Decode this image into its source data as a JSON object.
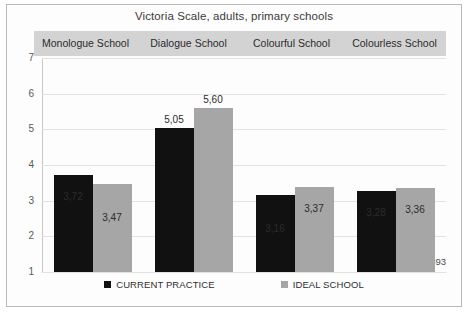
{
  "chart_data": {
    "type": "bar",
    "title": "Victoria Scale, adults, primary schools",
    "xlabel": "",
    "ylabel": "",
    "ylim": [
      1,
      7
    ],
    "yticks": [
      "7",
      "6",
      "5",
      "4",
      "3",
      "2",
      "1"
    ],
    "grid": true,
    "legend_position": "bottom",
    "categories": [
      "Monologue School",
      "Dialogue School",
      "Colourful School",
      "Colourless School"
    ],
    "series": [
      {
        "name": "CURRENT PRACTICE",
        "color": "#111111",
        "values": [
          3.72,
          5.05,
          3.16,
          3.28
        ],
        "labels": [
          "3,72",
          "5,05",
          "3,16",
          "3,28"
        ]
      },
      {
        "name": "IDEAL SCHOOL",
        "color": "#a6a6a6",
        "values": [
          3.47,
          5.6,
          3.37,
          3.36
        ],
        "labels": [
          "3,47",
          "5,60",
          "3,37",
          "3,36"
        ]
      }
    ],
    "annotations": [
      "n=3393"
    ]
  },
  "chart": {
    "title": "Victoria Scale, adults, primary schools",
    "sample_size_note": "n=3393"
  },
  "legend": {
    "items": [
      {
        "label": "CURRENT PRACTICE",
        "color": "#111111"
      },
      {
        "label": "IDEAL SCHOOL",
        "color": "#a6a6a6"
      }
    ]
  }
}
